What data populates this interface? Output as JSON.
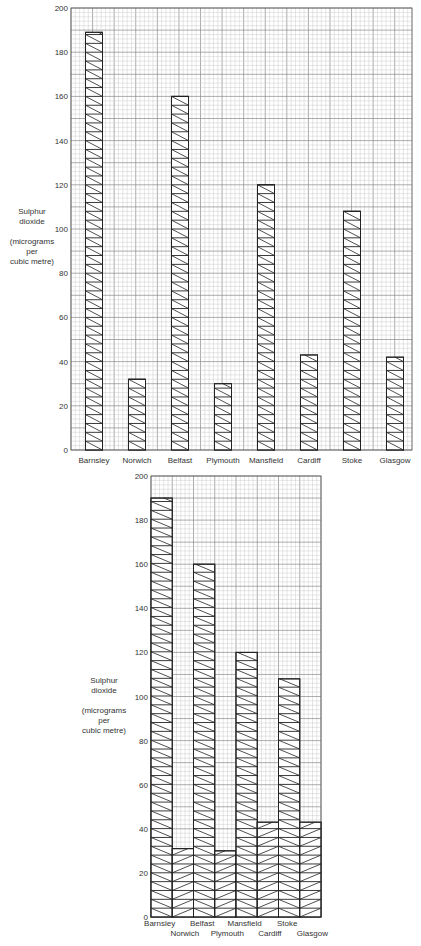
{
  "chart_data": [
    {
      "type": "bar",
      "title": "",
      "xlabel": "",
      "ylabel": "Sulphur dioxide (micrograms per cubic metre)",
      "ylabel_lines": [
        "Sulphur",
        "dioxide",
        "",
        "(micrograms",
        "per",
        "cubic metre)"
      ],
      "categories": [
        "Barnsley",
        "Norwich",
        "Belfast",
        "Plymouth",
        "Mansfield",
        "Cardiff",
        "Stoke",
        "Glasgow"
      ],
      "values": [
        189,
        32,
        160,
        30,
        120,
        43,
        108,
        42
      ],
      "ylim": [
        0,
        200
      ],
      "yticks": [
        0,
        20,
        40,
        60,
        80,
        100,
        120,
        140,
        160,
        180,
        200
      ],
      "grid": true,
      "bar_style": "separated bars, diagonal hatching",
      "legend": null
    },
    {
      "type": "bar",
      "title": "",
      "xlabel": "",
      "ylabel": "Sulphur dioxide (micrograms per cubic metre)",
      "ylabel_lines": [
        "Sulphur",
        "dioxide",
        "",
        "(micrograms",
        "per",
        "cubic metre)"
      ],
      "categories": [
        "Barnsley",
        "Norwich",
        "Belfast",
        "Plymouth",
        "Mansfield",
        "Cardiff",
        "Stoke",
        "Glasgow"
      ],
      "values": [
        190,
        31,
        160,
        30,
        120,
        43,
        108,
        43
      ],
      "ylim": [
        0,
        200
      ],
      "yticks": [
        0,
        20,
        40,
        60,
        80,
        100,
        120,
        140,
        160,
        180,
        200
      ],
      "grid": true,
      "bar_style": "adjacent bars, alternating hatching direction",
      "legend": null
    }
  ],
  "colors": {
    "grid_minor": "#c8c8c8",
    "grid_major": "#8a8a8a",
    "bar_outline": "#222222",
    "hatch": "#222222",
    "background": "#ffffff"
  }
}
